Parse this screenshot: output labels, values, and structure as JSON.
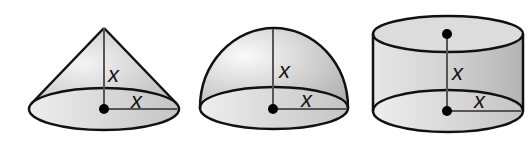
{
  "diagram": {
    "type": "geometric-solids",
    "shapes": [
      {
        "name": "cone",
        "height_label": "x",
        "radius_label": "x"
      },
      {
        "name": "hemisphere",
        "height_label": "x",
        "radius_label": "x"
      },
      {
        "name": "cylinder",
        "height_label": "x",
        "radius_label": "x"
      }
    ]
  }
}
